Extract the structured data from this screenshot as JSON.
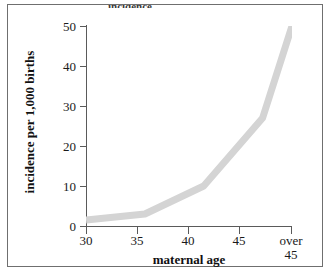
{
  "figure": {
    "background_color": "#ffffff",
    "frame_color": "#6f6f6f",
    "title_remnant": "incidence"
  },
  "chart_data": {
    "type": "line",
    "title": "",
    "xlabel": "maternal age",
    "ylabel": "incidence per 1,000 births",
    "categories": [
      "30",
      "35",
      "40",
      "45",
      "over 45"
    ],
    "x": [
      30,
      35,
      40,
      45,
      47.5
    ],
    "values": [
      1.5,
      3,
      10,
      27,
      50
    ],
    "series": [
      {
        "name": "incidence per 1,000 births",
        "values": [
          1.5,
          3,
          10,
          27,
          50
        ],
        "color": "#d4d4d4"
      }
    ],
    "xlim": [
      30,
      47.5
    ],
    "ylim": [
      0,
      50
    ],
    "x_ticks": [
      30,
      35,
      40,
      45,
      47.5
    ],
    "x_tick_labels": [
      "30",
      "35",
      "40",
      "45",
      "over 45"
    ],
    "y_ticks": [
      0,
      10,
      20,
      30,
      40,
      50
    ],
    "y_tick_labels": [
      "0",
      "10",
      "20",
      "30",
      "40",
      "50"
    ],
    "grid": false,
    "legend": false,
    "line_color": "#d4d4d4",
    "line_width": 7
  },
  "axes": {
    "y": {
      "title": "incidence per 1,000 births",
      "ticks": [
        {
          "label": "50",
          "value": 50
        },
        {
          "label": "40",
          "value": 40
        },
        {
          "label": "30",
          "value": 30
        },
        {
          "label": "20",
          "value": 20
        },
        {
          "label": "10",
          "value": 10
        },
        {
          "label": "0",
          "value": 0
        }
      ]
    },
    "x": {
      "title": "maternal age",
      "ticks": [
        {
          "label": "30",
          "value": 30
        },
        {
          "label": "35",
          "value": 35
        },
        {
          "label": "40",
          "value": 40
        },
        {
          "label": "45",
          "value": 45
        },
        {
          "label": "over\n45",
          "line1": "over",
          "line2": "45",
          "value": 47.5
        }
      ]
    }
  }
}
